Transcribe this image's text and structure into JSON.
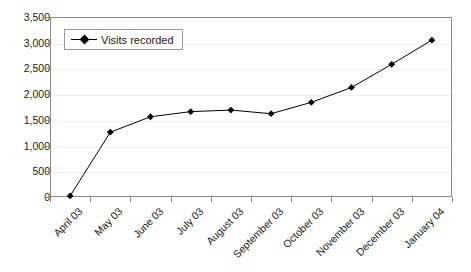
{
  "chart_data": {
    "type": "line",
    "title": "",
    "xlabel": "",
    "ylabel": "",
    "grid": true,
    "legend_position": "top-left",
    "ylim": [
      0,
      3500
    ],
    "yticks": [
      "0",
      "500",
      "1,000",
      "1,500",
      "2,000",
      "2,500",
      "3,000",
      "3,500"
    ],
    "ytick_values": [
      0,
      500,
      1000,
      1500,
      2000,
      2500,
      3000,
      3500
    ],
    "categories": [
      "April 03",
      "May 03",
      "June 03",
      "July 03",
      "August 03",
      "September 03",
      "October 03",
      "November 03",
      "December 03",
      "January 04"
    ],
    "series": [
      {
        "name": "Visits recorded",
        "color": "#000000",
        "marker": "diamond",
        "values": [
          20,
          1260,
          1560,
          1660,
          1690,
          1620,
          1840,
          2130,
          2580,
          3050
        ]
      }
    ]
  },
  "legend": {
    "entries": [
      {
        "label": "Visits recorded"
      }
    ]
  },
  "axes": {
    "y_tick_labels": [
      "3,500",
      "3,000",
      "2,500",
      "2,000",
      "1,500",
      "1,000",
      "500",
      "0"
    ],
    "x_tick_labels": [
      "April 03",
      "May 03",
      "June 03",
      "July 03",
      "August 03",
      "September 03",
      "October 03",
      "November 03",
      "December 03",
      "January 04"
    ]
  }
}
